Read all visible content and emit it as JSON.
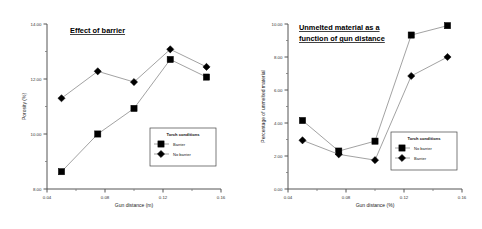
{
  "figure": {
    "panels": [
      "left",
      "right"
    ]
  },
  "chart_data": [
    {
      "type": "line",
      "id": "effect-of-barrier",
      "title": "Effect of barrier",
      "title_lines": [
        "Effect of barrier"
      ],
      "xlabel": "Gun distance (m)",
      "ylabel": "Porosity (%)",
      "xlim": [
        0.04,
        0.16
      ],
      "ylim": [
        8.0,
        14.0
      ],
      "xticks": [
        0.04,
        0.08,
        0.12,
        0.16
      ],
      "xtick_labels": [
        "0.04",
        "0.08",
        "0.12",
        "0.16"
      ],
      "yticks": [
        8.0,
        10.0,
        12.0,
        14.0
      ],
      "ytick_labels": [
        "8.00",
        "10.00",
        "12.00",
        "14.00"
      ],
      "minor_yticks": [
        9.0,
        11.0,
        13.0
      ],
      "minor_xticks": [
        0.06,
        0.1,
        0.14
      ],
      "grid": false,
      "legend_position": "lower-right",
      "legend_title": "Torch conditions",
      "x": [
        0.05,
        0.075,
        0.1,
        0.125,
        0.15
      ],
      "series": [
        {
          "name": "Barrier",
          "marker": "square",
          "values": [
            8.63,
            10.0,
            10.93,
            12.71,
            12.07
          ]
        },
        {
          "name": "No barrier",
          "marker": "diamond",
          "values": [
            11.3,
            12.28,
            11.89,
            13.08,
            12.44
          ]
        }
      ]
    },
    {
      "type": "line",
      "id": "unmelted-material",
      "title": "Unmelted material as a function of gun distance",
      "title_lines": [
        "Unmelted material as a",
        "function of gun distance"
      ],
      "xlabel": "Gun distance (%)",
      "ylabel": "Percentage of unmelted material",
      "xlim": [
        0.04,
        0.16
      ],
      "ylim": [
        0.0,
        10.0
      ],
      "xticks": [
        0.04,
        0.08,
        0.12,
        0.16
      ],
      "xtick_labels": [
        "0.04",
        "0.08",
        "0.12",
        "0.16"
      ],
      "yticks": [
        0.0,
        2.0,
        4.0,
        6.0,
        8.0,
        10.0
      ],
      "ytick_labels": [
        "0.00",
        "2.00",
        "4.00",
        "6.00",
        "8.00",
        "10.00"
      ],
      "minor_yticks": [
        1.0,
        3.0,
        5.0,
        7.0,
        9.0
      ],
      "minor_xticks": [
        0.06,
        0.1,
        0.14
      ],
      "grid": false,
      "legend_position": "lower-right",
      "legend_title": "Torch conditions",
      "x": [
        0.05,
        0.075,
        0.1,
        0.125,
        0.15
      ],
      "series": [
        {
          "name": "No barrier",
          "marker": "square",
          "values": [
            4.15,
            2.3,
            2.9,
            9.33,
            9.9
          ]
        },
        {
          "name": "Barrier",
          "marker": "diamond",
          "values": [
            2.95,
            2.1,
            1.75,
            6.85,
            8.0
          ]
        }
      ]
    }
  ]
}
